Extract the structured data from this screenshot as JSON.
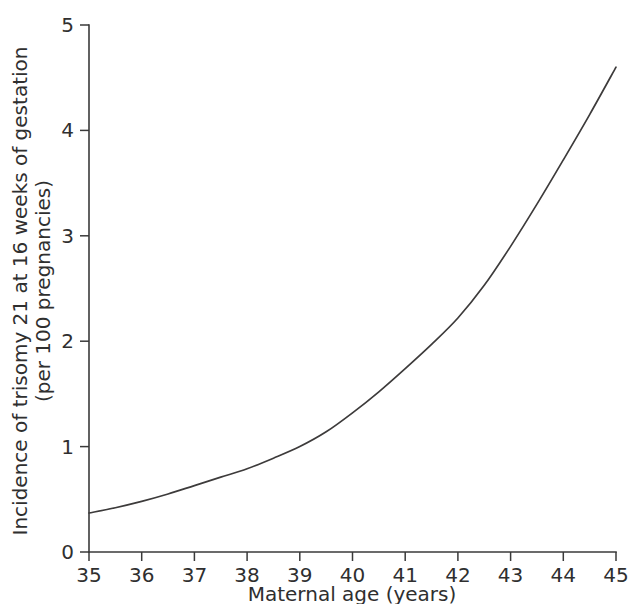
{
  "chart_data": {
    "type": "line",
    "title": "",
    "xlabel": "Maternal age (years)",
    "ylabel_line1": "Incidence of trisomy 21 at 16 weeks of gestation",
    "ylabel_line2": "(per 100 pregnancies)",
    "xlim": [
      35,
      45
    ],
    "ylim": [
      0,
      5
    ],
    "xticks": [
      35,
      36,
      37,
      38,
      39,
      40,
      41,
      42,
      43,
      44,
      45
    ],
    "xtick_labels": [
      "35",
      "36",
      "37",
      "38",
      "39",
      "40",
      "41",
      "42",
      "43",
      "44",
      "45"
    ],
    "yticks": [
      0,
      1,
      2,
      3,
      4,
      5
    ],
    "ytick_labels": [
      "0",
      "1",
      "2",
      "3",
      "4",
      "5"
    ],
    "grid": false,
    "legend": false,
    "legend_position": "none",
    "line_color": "#3d3b3b",
    "axis_color": "#3a3a3a",
    "background_color": "#ffffff",
    "series": [
      {
        "name": "Incidence of trisomy 21",
        "x": [
          35,
          35.5,
          36,
          36.5,
          37,
          37.5,
          38,
          38.5,
          39,
          39.5,
          40,
          40.5,
          41,
          41.5,
          42,
          42.5,
          43,
          43.5,
          44,
          44.5,
          45
        ],
        "values": [
          0.37,
          0.42,
          0.48,
          0.55,
          0.63,
          0.71,
          0.79,
          0.89,
          1.0,
          1.14,
          1.32,
          1.52,
          1.74,
          1.97,
          2.22,
          2.53,
          2.9,
          3.3,
          3.72,
          4.15,
          4.6
        ]
      }
    ]
  }
}
